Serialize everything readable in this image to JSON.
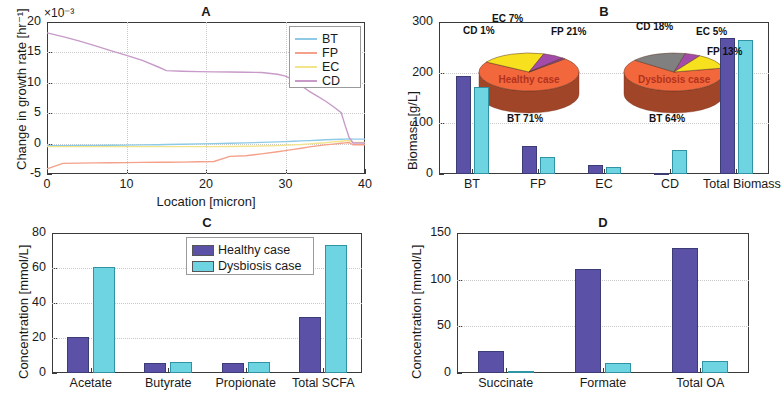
{
  "figure": {
    "panels": [
      "A",
      "B",
      "C",
      "D"
    ]
  },
  "panelA": {
    "title": "A",
    "ylabel": "Change in growth rate [hr⁻¹]",
    "xlabel": "Location [micron]",
    "exponent": "×10⁻³",
    "yticks": [
      "-5",
      "0",
      "5",
      "10",
      "15",
      "20"
    ],
    "xticks": [
      "0",
      "10",
      "20",
      "30",
      "40"
    ],
    "legend": [
      "BT",
      "FP",
      "EC",
      "CD"
    ],
    "colors": {
      "BT": "#8ecae6",
      "FP": "#f4a08a",
      "EC": "#f2e48a",
      "CD": "#c79ac9"
    }
  },
  "panelB": {
    "title": "B",
    "ylabel": "Biomass [g/L]",
    "yticks": [
      "0",
      "100",
      "200",
      "300"
    ],
    "xticks": [
      "BT",
      "FP",
      "EC",
      "CD",
      "Total Biomass"
    ],
    "healthy_label": "Healthy case",
    "dysbiosis_label": "Dysbiosis case",
    "pie_healthy": {
      "center": "Healthy case",
      "labels": [
        "BT 71%",
        "FP 21%",
        "EC 7%",
        "CD 1%"
      ]
    },
    "pie_dysbiosis": {
      "center": "Dysbiosis case",
      "labels": [
        "BT 64%",
        "CD 18%",
        "EC 5%",
        "FP 13%"
      ]
    }
  },
  "panelC": {
    "title": "C",
    "ylabel": "Concentration [mmol/L]",
    "yticks": [
      "0",
      "20",
      "40",
      "60",
      "80"
    ],
    "xticks": [
      "Acetate",
      "Butyrate",
      "Propionate",
      "Total SCFA"
    ],
    "legend": [
      "Healthy case",
      "Dysbiosis case"
    ]
  },
  "panelD": {
    "title": "D",
    "ylabel": "Concentration [mmol/L]",
    "yticks": [
      "0",
      "50",
      "100",
      "150"
    ],
    "xticks": [
      "Succinate",
      "Formate",
      "Total OA"
    ]
  },
  "colors": {
    "healthy": "#5b51a6",
    "dysbiosis": "#6fd4e2",
    "pie_bt": "#f2683c",
    "pie_fp": "#f7e11e",
    "pie_ec": "#a34ba8",
    "pie_cd_healthy": "#8b3f9e",
    "pie_cd_dys": "#808080",
    "pie_side": "#a8432a"
  },
  "chart_data": [
    {
      "type": "line",
      "panel": "A",
      "title": "A",
      "xlabel": "Location [micron]",
      "ylabel": "Change in growth rate [hr^-1]",
      "y_multiplier": 0.001,
      "xlim": [
        0,
        40
      ],
      "ylim": [
        -5,
        20
      ],
      "grid": true,
      "legend_position": "top-right",
      "x": [
        0,
        2,
        4,
        6,
        8,
        10,
        12,
        14,
        15,
        17,
        19,
        21,
        23,
        25,
        27,
        29,
        30,
        31,
        32,
        33,
        34,
        35,
        36,
        37,
        37.5,
        38,
        38.5,
        39,
        40
      ],
      "series": [
        {
          "name": "BT",
          "color": "#8ecae6",
          "values": [
            -0.35,
            -0.33,
            -0.32,
            -0.3,
            -0.28,
            -0.25,
            -0.22,
            -0.18,
            -0.15,
            -0.1,
            -0.05,
            0.0,
            0.06,
            0.12,
            0.2,
            0.28,
            0.33,
            0.38,
            0.44,
            0.5,
            0.56,
            0.62,
            0.68,
            0.72,
            0.74,
            0.75,
            0.74,
            0.74,
            0.74
          ]
        },
        {
          "name": "FP",
          "color": "#f4a08a",
          "values": [
            -4.15,
            -3.25,
            -3.2,
            -3.18,
            -3.15,
            -3.12,
            -3.1,
            -3.08,
            -3.06,
            -3.04,
            -3.0,
            -2.95,
            -2.1,
            -2.0,
            -1.7,
            -1.35,
            -1.15,
            -0.95,
            -0.75,
            -0.55,
            -0.38,
            -0.22,
            -0.08,
            0.05,
            0.12,
            0.18,
            -0.2,
            -0.2,
            -0.2
          ]
        },
        {
          "name": "EC",
          "color": "#f2e48a",
          "values": [
            -0.5,
            -0.5,
            -0.5,
            -0.5,
            -0.5,
            -0.5,
            -0.5,
            -0.5,
            -0.5,
            -0.5,
            -0.5,
            -0.5,
            -0.48,
            -0.45,
            -0.4,
            -0.33,
            -0.28,
            -0.22,
            -0.14,
            -0.05,
            0.05,
            0.15,
            0.28,
            0.4,
            0.46,
            0.5,
            0.2,
            0.2,
            0.2
          ]
        },
        {
          "name": "CD",
          "color": "#c79ac9",
          "values": [
            18.2,
            17.6,
            16.9,
            16.1,
            15.3,
            14.5,
            13.7,
            12.6,
            12.0,
            11.9,
            11.85,
            11.8,
            11.78,
            11.75,
            11.7,
            11.4,
            11.1,
            10.5,
            9.5,
            8.6,
            7.8,
            7.0,
            6.1,
            5.1,
            3.0,
            1.0,
            0.1,
            0.1,
            0.1
          ]
        }
      ]
    },
    {
      "type": "bar",
      "panel": "B",
      "title": "B",
      "ylabel": "Biomass [g/L]",
      "xlabel": "",
      "categories": [
        "BT",
        "FP",
        "EC",
        "CD",
        "Total Biomass"
      ],
      "ylim": [
        0,
        300
      ],
      "yticks": [
        0,
        100,
        200,
        300
      ],
      "series": [
        {
          "name": "Healthy case",
          "color": "#5b51a6",
          "values": [
            193,
            56,
            18,
            2,
            268
          ]
        },
        {
          "name": "Dysbiosis case",
          "color": "#6fd4e2",
          "values": [
            172,
            34,
            14,
            47,
            265
          ]
        }
      ],
      "insets": [
        {
          "type": "pie",
          "title": "Healthy case",
          "categories": [
            "BT",
            "FP",
            "EC",
            "CD"
          ],
          "values": [
            71,
            21,
            7,
            1
          ],
          "labels": [
            "BT 71%",
            "FP 21%",
            "EC 7%",
            "CD 1%"
          ],
          "colors": [
            "#f2683c",
            "#f7e11e",
            "#a34ba8",
            "#8b3f9e"
          ]
        },
        {
          "type": "pie",
          "title": "Dysbiosis case",
          "categories": [
            "BT",
            "CD",
            "EC",
            "FP"
          ],
          "values": [
            64,
            18,
            5,
            13
          ],
          "labels": [
            "BT 64%",
            "CD 18%",
            "EC 5%",
            "FP 13%"
          ],
          "colors": [
            "#f2683c",
            "#808080",
            "#a34ba8",
            "#f7e11e"
          ]
        }
      ]
    },
    {
      "type": "bar",
      "panel": "C",
      "title": "C",
      "ylabel": "Concentration [mmol/L]",
      "xlabel": "",
      "categories": [
        "Acetate",
        "Butyrate",
        "Propionate",
        "Total SCFA"
      ],
      "ylim": [
        0,
        80
      ],
      "yticks": [
        0,
        20,
        40,
        60,
        80
      ],
      "series": [
        {
          "name": "Healthy case",
          "color": "#5b51a6",
          "values": [
            20.5,
            5.8,
            5.9,
            32
          ]
        },
        {
          "name": "Dysbiosis case",
          "color": "#6fd4e2",
          "values": [
            60.5,
            6.2,
            6.3,
            73
          ]
        }
      ]
    },
    {
      "type": "bar",
      "panel": "D",
      "title": "D",
      "ylabel": "Concentration [mmol/L]",
      "xlabel": "",
      "categories": [
        "Succinate",
        "Formate",
        "Total OA"
      ],
      "ylim": [
        0,
        150
      ],
      "yticks": [
        0,
        50,
        100,
        150
      ],
      "series": [
        {
          "name": "Healthy case",
          "color": "#5b51a6",
          "values": [
            24,
            111,
            134
          ]
        },
        {
          "name": "Dysbiosis case",
          "color": "#6fd4e2",
          "values": [
            2,
            11,
            13
          ]
        }
      ]
    }
  ]
}
